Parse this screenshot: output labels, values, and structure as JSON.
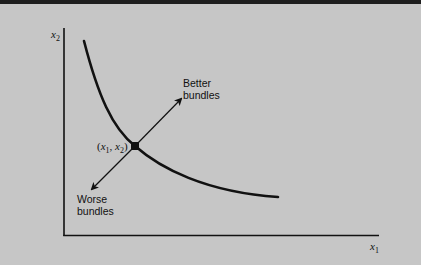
{
  "diagram": {
    "type": "indifference-curve",
    "axes": {
      "x_label": "x",
      "x_label_subscript": "1",
      "y_label": "x",
      "y_label_subscript": "2"
    },
    "point_label": {
      "open": "(",
      "x": "x",
      "x_sub": "1",
      "sep": ", ",
      "y": "x",
      "y_sub": "2",
      "close": ")"
    },
    "arrows": {
      "better": {
        "line1": "Better",
        "line2": "bundles"
      },
      "worse": {
        "line1": "Worse",
        "line2": "bundles"
      }
    },
    "colors": {
      "background": "#c6c6c6",
      "ink": "#111111",
      "top_rule": "#1e1e1e"
    }
  }
}
